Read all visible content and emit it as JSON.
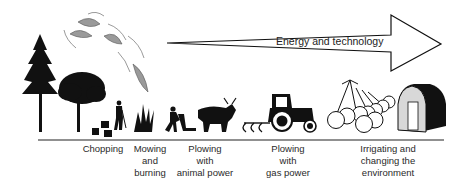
{
  "diagram": {
    "arrow": {
      "label": "Energy and technology",
      "direction": "left-to-right"
    },
    "stages": [
      {
        "id": "chopping",
        "lines": [
          "Chopping"
        ],
        "icon": "axe-chopping-icon"
      },
      {
        "id": "mowing-burning",
        "lines": [
          "Mowing",
          "and",
          "burning"
        ],
        "icon": "fire-icon"
      },
      {
        "id": "plowing-animal",
        "lines": [
          "Plowing",
          "with",
          "animal power"
        ],
        "icon": "ox-plow-icon"
      },
      {
        "id": "plowing-gas",
        "lines": [
          "Plowing",
          "with",
          "gas power"
        ],
        "icon": "tractor-icon"
      },
      {
        "id": "irrigating",
        "lines": [
          "Irrigating and",
          "changing the",
          "environment"
        ],
        "icon": "irrigation-greenhouse-icon"
      }
    ],
    "colors": {
      "ink": "#111111",
      "smoke_fill": "#9a9a9a",
      "greenhouse_fill": "#d8d8d8",
      "background": "#ffffff"
    }
  }
}
